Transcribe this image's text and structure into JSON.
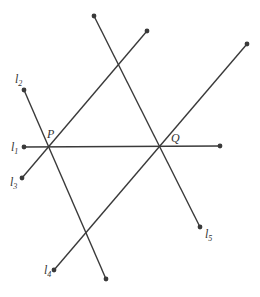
{
  "diagram": {
    "points": {
      "P": {
        "label": "P",
        "x": 47,
        "y": 147
      },
      "Q": {
        "label": "Q",
        "x": 160,
        "y": 146
      }
    },
    "lines": [
      {
        "name": "l1",
        "label": "l",
        "sub": "1",
        "x1": 24,
        "y1": 147,
        "x2": 220,
        "y2": 146
      },
      {
        "name": "l2",
        "label": "l",
        "sub": "2",
        "x1": 24,
        "y1": 90,
        "x2": 106,
        "y2": 279
      },
      {
        "name": "l3",
        "label": "l",
        "sub": "3",
        "x1": 22,
        "y1": 178,
        "x2": 147,
        "y2": 31
      },
      {
        "name": "l4",
        "label": "l",
        "sub": "4",
        "x1": 54,
        "y1": 270,
        "x2": 247,
        "y2": 44
      },
      {
        "name": "l5",
        "label": "l",
        "sub": "5",
        "x1": 94,
        "y1": 16,
        "x2": 200,
        "y2": 227
      }
    ],
    "labels": {
      "l1": {
        "x": 11,
        "y": 151
      },
      "l2": {
        "x": 15,
        "y": 83
      },
      "l3": {
        "x": 10,
        "y": 186
      },
      "l4": {
        "x": 44,
        "y": 274
      },
      "l5": {
        "x": 205,
        "y": 238
      },
      "P": {
        "x": 47,
        "y": 138
      },
      "Q": {
        "x": 171,
        "y": 142
      }
    }
  }
}
